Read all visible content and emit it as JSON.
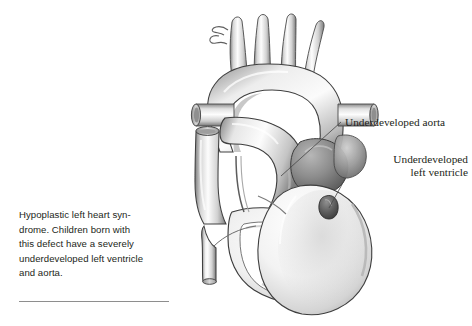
{
  "figure": {
    "kind": "medical-illustration",
    "subject": "heart",
    "view": "anterior cutaway",
    "background_color": "#ffffff",
    "ink_color": "#231f20",
    "rule_color": "#8e8e8e"
  },
  "caption": {
    "text": "Hypoplastic left heart syn-\ndrome. Children born with\nthis defect have a severely\nunderdeveloped left ventricle\nand aorta."
  },
  "callouts": [
    {
      "id": "aorta",
      "label": "Underdeveloped aorta",
      "align": "left"
    },
    {
      "id": "left-ventricle",
      "label": "Underdeveloped\nleft ventricle",
      "align": "right"
    }
  ],
  "palette": {
    "vessel_light": "#f4f4f4",
    "vessel_mid": "#c9c9c9",
    "vessel_dark": "#6f6f6f",
    "chamber_light": "#fbfbfb",
    "chamber_mid": "#d8d8d8",
    "mass_dark": "#6a6a6a",
    "outline": "#3a3a3a",
    "lv_nub": "#4c4c4c"
  }
}
